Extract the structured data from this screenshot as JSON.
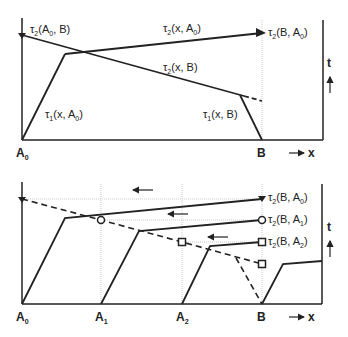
{
  "top_panel": {
    "labels": {
      "tau2_A0_B": "τ",
      "tau2_A0_B_sub": "2",
      "tau2_A0_B_args": "(A",
      "tau2_A0_B_argsub": "0",
      "tau2_A0_B_end": ", B)",
      "tau2_x_A0": "τ",
      "tau2_x_A0_sub": "2",
      "tau2_x_A0_args": "(x, A",
      "tau2_x_A0_argsub": "0",
      "tau2_x_A0_end": ")",
      "tau2_B_A0": "τ",
      "tau2_B_A0_sub": "2",
      "tau2_B_A0_args": "(B, A",
      "tau2_B_A0_argsub": "0",
      "tau2_B_A0_end": ")",
      "tau2_x_B": "τ",
      "tau2_x_B_sub": "2",
      "tau2_x_B_args": "(x, B)",
      "tau1_x_A0": "τ",
      "tau1_x_A0_sub": "1",
      "tau1_x_A0_args": "(x, A",
      "tau1_x_A0_argsub": "0",
      "tau1_x_A0_end": ")",
      "tau1_x_B": "τ",
      "tau1_x_B_sub": "1",
      "tau1_x_B_args": "(x, B)"
    },
    "axis": {
      "A0": "A",
      "A0_sub": "0",
      "B": "B",
      "x": "x",
      "t": "t"
    }
  },
  "bottom_panel": {
    "labels": {
      "tau2_B_A0": "τ",
      "tau2_B_A0_sub": "2",
      "tau2_B_A0_args": "(B, A",
      "tau2_B_A0_argsub": "0",
      "tau2_B_A0_end": ")",
      "tau2_B_A1": "τ",
      "tau2_B_A1_sub": "2",
      "tau2_B_A1_args": "(B, A",
      "tau2_B_A1_argsub": "1",
      "tau2_B_A1_end": ")",
      "tau2_B_A2": "τ",
      "tau2_B_A2_sub": "2",
      "tau2_B_A2_args": "(B, A",
      "tau2_B_A2_argsub": "2",
      "tau2_B_A2_end": ")"
    },
    "axis": {
      "A0": "A",
      "A0_sub": "0",
      "A1": "A",
      "A1_sub": "1",
      "A2": "A",
      "A2_sub": "2",
      "B": "B",
      "x": "x",
      "t": "t"
    },
    "markers": {
      "A1": "circle",
      "A2": "square"
    }
  },
  "colors": {
    "line": "#222222",
    "guide": "#bbbbbb"
  }
}
